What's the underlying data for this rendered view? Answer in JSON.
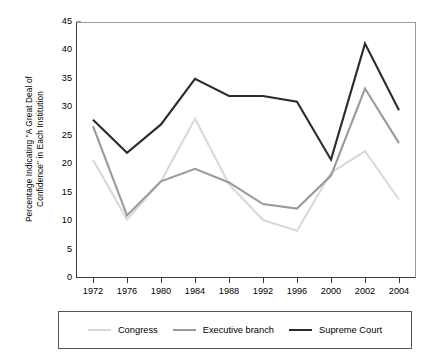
{
  "chart_data": {
    "type": "line",
    "title": "",
    "xlabel": "",
    "ylabel": "Percentage Indicating \"A Great Deal of Confidence\" in Each Institution",
    "ylabel_lines": [
      "Percentage Indicating \"A Great Deal of",
      "Confidence\" in Each Institution"
    ],
    "categories": [
      "1972",
      "1976",
      "1980",
      "1984",
      "1988",
      "1992",
      "1996",
      "2000",
      "2002",
      "2004"
    ],
    "ylim": [
      0,
      45
    ],
    "yticks": [
      0,
      5,
      10,
      15,
      20,
      25,
      30,
      35,
      40,
      45
    ],
    "ytick_labels": [
      "0",
      "5",
      "10",
      "15",
      "20",
      "25",
      "30",
      "35",
      "40",
      "45"
    ],
    "grid": false,
    "legend_position": "bottom",
    "series": [
      {
        "name": "Congress",
        "color": "#d9d9d9",
        "values": [
          20.8,
          10.3,
          17.0,
          28.0,
          16.5,
          10.2,
          8.3,
          18.5,
          22.3,
          13.8
        ]
      },
      {
        "name": "Executive branch",
        "color": "#9a9a9a",
        "values": [
          26.7,
          11.0,
          17.0,
          19.2,
          16.8,
          13.0,
          12.2,
          18.0,
          33.3,
          23.7
        ]
      },
      {
        "name": "Supreme Court",
        "color": "#2b2b2b",
        "values": [
          27.8,
          22.0,
          27.0,
          35.0,
          32.0,
          32.0,
          31.0,
          20.8,
          41.2,
          29.5
        ]
      }
    ]
  },
  "legend": {
    "items": [
      {
        "label": "Congress",
        "color": "#d9d9d9"
      },
      {
        "label": "Executive branch",
        "color": "#9a9a9a"
      },
      {
        "label": "Supreme Court",
        "color": "#2b2b2b"
      }
    ]
  },
  "axis": {
    "axis_color": "#3a3a3a",
    "frame_color": "#9a9a9a"
  }
}
